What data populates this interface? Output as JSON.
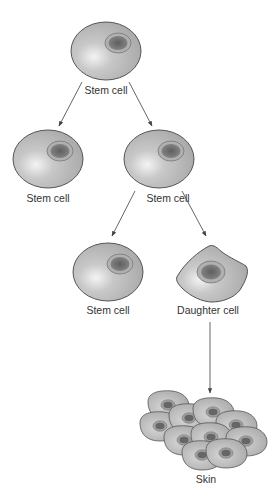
{
  "diagram": {
    "colors": {
      "cell_fill": "#b4b4b4",
      "cell_highlight": "#f2f2f2",
      "cell_stroke": "#555555",
      "nucleus_ring": "#a8a8a8",
      "nucleus_core": "#6a6a6a",
      "arrow": "#555555",
      "text": "#333333"
    },
    "nodes": [
      {
        "id": "stem-top",
        "label": "Stem cell",
        "type": "stem-cell"
      },
      {
        "id": "stem-mid-left",
        "label": "Stem cell",
        "type": "stem-cell"
      },
      {
        "id": "stem-mid-right",
        "label": "Stem cell",
        "type": "stem-cell"
      },
      {
        "id": "stem-bottom",
        "label": "Stem cell",
        "type": "stem-cell"
      },
      {
        "id": "daughter",
        "label": "Daughter cell",
        "type": "daughter-cell"
      },
      {
        "id": "skin",
        "label": "Skin",
        "type": "tissue"
      }
    ],
    "edges": [
      {
        "from": "stem-top",
        "to": "stem-mid-left"
      },
      {
        "from": "stem-top",
        "to": "stem-mid-right"
      },
      {
        "from": "stem-mid-right",
        "to": "stem-bottom"
      },
      {
        "from": "stem-mid-right",
        "to": "daughter"
      },
      {
        "from": "daughter",
        "to": "skin"
      }
    ]
  }
}
